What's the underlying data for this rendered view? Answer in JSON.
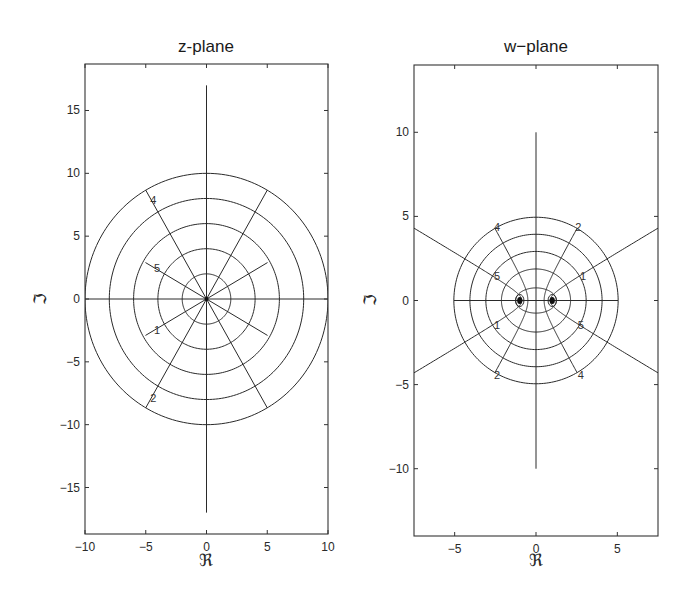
{
  "chart_data": [
    {
      "type": "line",
      "id": "z-plane",
      "title": "z-plane",
      "xlabel": "ℜ",
      "ylabel": "ℑ",
      "xlim": [
        -10,
        10
      ],
      "ylim": [
        -18.7,
        18.7
      ],
      "xticks": [
        -10,
        -5,
        0,
        5,
        10
      ],
      "xtick_labels": [
        "−10",
        "−5",
        "0",
        "5",
        "10"
      ],
      "yticks": [
        -15,
        -10,
        -5,
        0,
        5,
        10,
        15
      ],
      "ytick_labels": [
        "−15",
        "−10",
        "−5",
        "0",
        "5",
        "10",
        "15"
      ],
      "grid": false,
      "circles": [
        2,
        4,
        6,
        8,
        10
      ],
      "lines": [
        {
          "from": [
            -10,
            0
          ],
          "to": [
            10,
            0
          ]
        },
        {
          "from": [
            0,
            -17
          ],
          "to": [
            0,
            17
          ]
        }
      ],
      "rays": [
        {
          "angle_deg": 30,
          "length": 5.8
        },
        {
          "angle_deg": 60,
          "length": 10
        },
        {
          "angle_deg": 120,
          "length": 10,
          "label": "4"
        },
        {
          "angle_deg": 150,
          "length": 5.8,
          "label": "5"
        },
        {
          "angle_deg": 210,
          "length": 5.8,
          "label": "1"
        },
        {
          "angle_deg": 240,
          "length": 10,
          "label": "2"
        },
        {
          "angle_deg": 300,
          "length": 10
        },
        {
          "angle_deg": 330,
          "length": 5.8
        }
      ]
    },
    {
      "type": "line",
      "id": "w-plane",
      "title": "w−plane",
      "xlabel": "ℜ",
      "ylabel": "ℑ",
      "xlim": [
        -7.5,
        7.5
      ],
      "ylim": [
        -14,
        14
      ],
      "xticks": [
        -5,
        0,
        5
      ],
      "xtick_labels": [
        "−5",
        "0",
        "5"
      ],
      "yticks": [
        -10,
        -5,
        0,
        5,
        10
      ],
      "ytick_labels": [
        "−10",
        "−5",
        "0",
        "5",
        "10"
      ],
      "grid": false,
      "mapping": "w = (z + 1/z) / 2",
      "ellipses_from_radii": [
        2,
        4,
        6,
        8,
        10
      ],
      "foci": [
        [
          -1,
          0
        ],
        [
          1,
          0
        ]
      ],
      "lines": [
        {
          "from": [
            -5.05,
            0
          ],
          "to": [
            5.05,
            0
          ]
        },
        {
          "from": [
            0,
            -10
          ],
          "to": [
            0,
            10
          ]
        }
      ],
      "hyperbolas": [
        {
          "angle_deg": 30,
          "tmax": 3.0,
          "label": "1",
          "label_pos": [
            2.9,
            1.45
          ]
        },
        {
          "angle_deg": 60,
          "tmax": 2.3026,
          "label": "2",
          "label_pos": [
            2.6,
            4.35
          ]
        },
        {
          "angle_deg": 120,
          "tmax": 2.3026,
          "label": "4",
          "label_pos": [
            -2.4,
            4.35
          ]
        },
        {
          "angle_deg": 150,
          "tmax": 3.0,
          "label": "5",
          "label_pos": [
            -2.4,
            1.45
          ]
        },
        {
          "angle_deg": 210,
          "tmax": 3.0,
          "label": "1",
          "label_pos": [
            -2.4,
            -1.45
          ]
        },
        {
          "angle_deg": 240,
          "tmax": 2.3026,
          "label": "2",
          "label_pos": [
            -2.4,
            -4.4
          ]
        },
        {
          "angle_deg": 300,
          "tmax": 2.3026,
          "label": "4",
          "label_pos": [
            2.75,
            -4.4
          ]
        },
        {
          "angle_deg": 330,
          "tmax": 3.0,
          "label": "5",
          "label_pos": [
            2.75,
            -1.45
          ]
        }
      ]
    }
  ],
  "figure": {
    "panels": [
      {
        "title": "z-plane",
        "xlabel": "ℜ",
        "ylabel": "ℑ"
      },
      {
        "title": "w−plane",
        "xlabel": "ℜ",
        "ylabel": "ℑ"
      }
    ]
  }
}
